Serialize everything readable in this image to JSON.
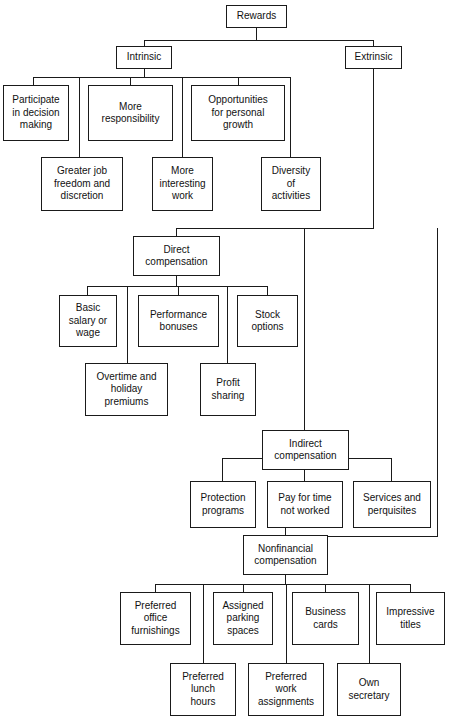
{
  "diagram": {
    "title": "Rewards",
    "type": "hierarchy-tree",
    "line_color": "#1a1a1a",
    "box_fill": "#ffffff",
    "nodes": [
      {
        "id": "rewards",
        "label": "Rewards",
        "x": 226,
        "y": 5,
        "w": 61,
        "h": 23
      },
      {
        "id": "intrinsic",
        "label": "Intrinsic",
        "x": 116,
        "y": 46,
        "w": 56,
        "h": 23
      },
      {
        "id": "extrinsic",
        "label": "Extrinsic",
        "x": 345,
        "y": 46,
        "w": 57,
        "h": 23
      },
      {
        "id": "participate",
        "label": "Participate\nin decision\nmaking",
        "x": 3,
        "y": 85,
        "w": 66,
        "h": 56
      },
      {
        "id": "moreresp",
        "label": "More\nresponsibility",
        "x": 88,
        "y": 85,
        "w": 85,
        "h": 56
      },
      {
        "id": "opportunities",
        "label": "Opportunities\nfor personal\ngrowth",
        "x": 191,
        "y": 85,
        "w": 94,
        "h": 56
      },
      {
        "id": "greaterjob",
        "label": "Greater job\nfreedom and\ndiscretion",
        "x": 41,
        "y": 157,
        "w": 82,
        "h": 54
      },
      {
        "id": "moreinteresting",
        "label": "More\ninteresting\nwork",
        "x": 152,
        "y": 157,
        "w": 61,
        "h": 54
      },
      {
        "id": "diversity",
        "label": "Diversity\nof\nactivities",
        "x": 261,
        "y": 157,
        "w": 60,
        "h": 54
      },
      {
        "id": "direct",
        "label": "Direct\ncompensation",
        "x": 133,
        "y": 236,
        "w": 87,
        "h": 40
      },
      {
        "id": "basicsalary",
        "label": "Basic\nsalary or\nwage",
        "x": 59,
        "y": 295,
        "w": 58,
        "h": 52
      },
      {
        "id": "perfbonus",
        "label": "Performance\nbonuses",
        "x": 138,
        "y": 295,
        "w": 81,
        "h": 52
      },
      {
        "id": "stockoptions",
        "label": "Stock\noptions",
        "x": 237,
        "y": 295,
        "w": 61,
        "h": 52
      },
      {
        "id": "overtime",
        "label": "Overtime and\nholiday\npremiums",
        "x": 85,
        "y": 363,
        "w": 83,
        "h": 53
      },
      {
        "id": "profitsharing",
        "label": "Profit\nsharing",
        "x": 200,
        "y": 363,
        "w": 56,
        "h": 53
      },
      {
        "id": "indirect",
        "label": "Indirect\ncompensation",
        "x": 262,
        "y": 430,
        "w": 87,
        "h": 40
      },
      {
        "id": "protection",
        "label": "Protection\nprograms",
        "x": 190,
        "y": 481,
        "w": 66,
        "h": 47
      },
      {
        "id": "payfortime",
        "label": "Pay for time\nnot worked",
        "x": 267,
        "y": 481,
        "w": 76,
        "h": 47
      },
      {
        "id": "services",
        "label": "Services and\nperquisites",
        "x": 353,
        "y": 481,
        "w": 78,
        "h": 47
      },
      {
        "id": "nonfinancial",
        "label": "Nonfinancial\ncompensation",
        "x": 243,
        "y": 535,
        "w": 85,
        "h": 40
      },
      {
        "id": "prefoffice",
        "label": "Preferred\noffice\nfurnishings",
        "x": 120,
        "y": 592,
        "w": 71,
        "h": 53
      },
      {
        "id": "assignedparking",
        "label": "Assigned\nparking\nspaces",
        "x": 213,
        "y": 592,
        "w": 60,
        "h": 53
      },
      {
        "id": "businesscards",
        "label": "Business\ncards",
        "x": 292,
        "y": 592,
        "w": 67,
        "h": 53
      },
      {
        "id": "impressive",
        "label": "Impressive\ntitles",
        "x": 376,
        "y": 592,
        "w": 69,
        "h": 53
      },
      {
        "id": "preflunch",
        "label": "Preferred\nlunch\nhours",
        "x": 170,
        "y": 663,
        "w": 66,
        "h": 53
      },
      {
        "id": "prefwork",
        "label": "Preferred\nwork\nassignments",
        "x": 248,
        "y": 663,
        "w": 76,
        "h": 53
      },
      {
        "id": "ownsecretary",
        "label": "Own\nsecretary",
        "x": 337,
        "y": 663,
        "w": 64,
        "h": 53
      }
    ],
    "edges": [
      {
        "id": "rewards-stem",
        "o": "v",
        "x": 256,
        "y": 28,
        "len": 13
      },
      {
        "id": "rewards-bus",
        "o": "h",
        "x": 144,
        "y": 40,
        "len": 230
      },
      {
        "id": "to-intrinsic",
        "o": "v",
        "x": 144,
        "y": 40,
        "len": 6
      },
      {
        "id": "to-extrinsic",
        "o": "v",
        "x": 373,
        "y": 40,
        "len": 6
      },
      {
        "id": "intrinsic-stem",
        "o": "v",
        "x": 144,
        "y": 69,
        "len": 9
      },
      {
        "id": "intrinsic-bus",
        "o": "h",
        "x": 33,
        "y": 77,
        "len": 257
      },
      {
        "id": "drop-participate",
        "o": "v",
        "x": 33,
        "y": 77,
        "len": 9
      },
      {
        "id": "drop-greaterjob",
        "o": "v",
        "x": 79,
        "y": 77,
        "len": 81
      },
      {
        "id": "drop-moreresp",
        "o": "v",
        "x": 130,
        "y": 77,
        "len": 9
      },
      {
        "id": "drop-moreinterest",
        "o": "v",
        "x": 182,
        "y": 77,
        "len": 81
      },
      {
        "id": "drop-opportunity",
        "o": "v",
        "x": 238,
        "y": 77,
        "len": 9
      },
      {
        "id": "drop-diversity",
        "o": "v",
        "x": 290,
        "y": 77,
        "len": 81
      },
      {
        "id": "extrinsic-stem",
        "o": "v",
        "x": 373,
        "y": 69,
        "len": 159
      },
      {
        "id": "extrinsic-bus",
        "o": "h",
        "x": 176,
        "y": 228,
        "len": 198
      },
      {
        "id": "to-direct",
        "o": "v",
        "x": 176,
        "y": 228,
        "len": 9
      },
      {
        "id": "to-indirect-line",
        "o": "v",
        "x": 304,
        "y": 228,
        "len": 204
      },
      {
        "id": "direct-stem",
        "o": "v",
        "x": 176,
        "y": 276,
        "len": 11
      },
      {
        "id": "direct-bus",
        "o": "h",
        "x": 87,
        "y": 286,
        "len": 181
      },
      {
        "id": "drop-basicsalary",
        "o": "v",
        "x": 87,
        "y": 286,
        "len": 10
      },
      {
        "id": "drop-overtime",
        "o": "v",
        "x": 127,
        "y": 286,
        "len": 78
      },
      {
        "id": "drop-perfbonus",
        "o": "v",
        "x": 178,
        "y": 286,
        "len": 10
      },
      {
        "id": "drop-profitshare",
        "o": "v",
        "x": 227,
        "y": 286,
        "len": 78
      },
      {
        "id": "drop-stockoption",
        "o": "v",
        "x": 267,
        "y": 286,
        "len": 10
      },
      {
        "id": "to-indirect-drop",
        "o": "v",
        "x": 304,
        "y": 420,
        "len": 11
      },
      {
        "id": "indirect-bus-l",
        "o": "h",
        "x": 222,
        "y": 458,
        "len": 41
      },
      {
        "id": "indirect-bus-r",
        "o": "h",
        "x": 348,
        "y": 458,
        "len": 44
      },
      {
        "id": "drop-protection",
        "o": "v",
        "x": 222,
        "y": 458,
        "len": 24
      },
      {
        "id": "drop-payfortime",
        "o": "v",
        "x": 304,
        "y": 470,
        "len": 12
      },
      {
        "id": "drop-services",
        "o": "v",
        "x": 391,
        "y": 458,
        "len": 24
      },
      {
        "id": "right-rail",
        "o": "v",
        "x": 437,
        "y": 228,
        "len": 309
      },
      {
        "id": "nonfin-bus",
        "o": "h",
        "x": 285,
        "y": 536,
        "len": 153
      },
      {
        "id": "nonfin-stem",
        "o": "v",
        "x": 285,
        "y": 526,
        "len": 10
      },
      {
        "id": "nonfin-drop",
        "o": "v",
        "x": 285,
        "y": 575,
        "len": 10
      },
      {
        "id": "bottom-bus",
        "o": "h",
        "x": 155,
        "y": 584,
        "len": 256
      },
      {
        "id": "drop-prefoffice",
        "o": "v",
        "x": 155,
        "y": 584,
        "len": 9
      },
      {
        "id": "drop-preflunch",
        "o": "v",
        "x": 203,
        "y": 584,
        "len": 80
      },
      {
        "id": "drop-assignedpark",
        "o": "v",
        "x": 243,
        "y": 584,
        "len": 9
      },
      {
        "id": "drop-prefwork",
        "o": "v",
        "x": 286,
        "y": 584,
        "len": 80
      },
      {
        "id": "drop-businesscard",
        "o": "v",
        "x": 325,
        "y": 584,
        "len": 9
      },
      {
        "id": "drop-ownsecretary",
        "o": "v",
        "x": 369,
        "y": 584,
        "len": 80
      },
      {
        "id": "drop-impressive",
        "o": "v",
        "x": 410,
        "y": 584,
        "len": 9
      }
    ]
  }
}
